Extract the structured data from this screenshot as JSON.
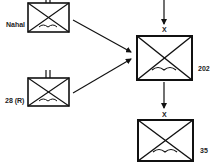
{
  "colors": {
    "stroke": "#111111",
    "label": "#222222",
    "background": "#ffffff"
  },
  "units": [
    {
      "id": "nahal",
      "label": "Nahal",
      "echelon": "II",
      "symbol": "airborne-infantry"
    },
    {
      "id": "28r",
      "label": "28 (R)",
      "echelon": "II",
      "symbol": "airborne-infantry"
    },
    {
      "id": "202",
      "label": "202",
      "echelon": "X",
      "symbol": "airborne-infantry"
    },
    {
      "id": "35",
      "label": "35",
      "echelon": "X",
      "symbol": "airborne-infantry"
    }
  ],
  "connections": [
    {
      "from": "off-screen-top",
      "to": "202"
    },
    {
      "from": "nahal",
      "to": "202"
    },
    {
      "from": "28r",
      "to": "202"
    },
    {
      "from": "202",
      "to": "35"
    }
  ]
}
